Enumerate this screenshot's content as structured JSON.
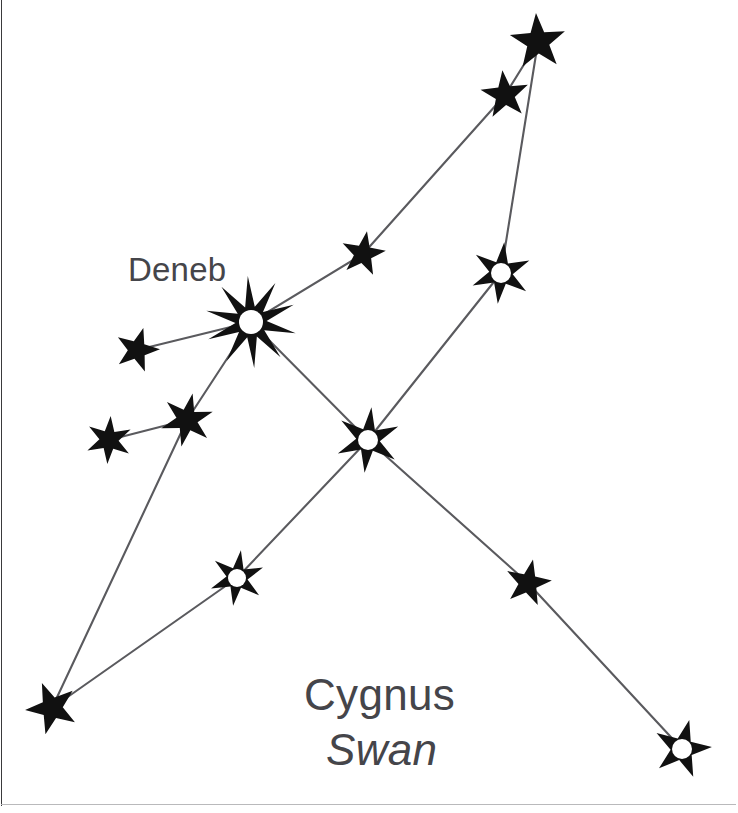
{
  "diagram": {
    "title": "Cygnus",
    "subtitle": "Swan",
    "kind": "constellation-star-chart",
    "canvas": {
      "width": 738,
      "height": 813
    },
    "colors": {
      "background": "#ffffff",
      "star_fill": "#111111",
      "line": "#5a5a5e",
      "text": "#45454a",
      "frame": "#3a3a3c"
    },
    "line_width": 2.1
  },
  "labels": {
    "deneb": "Deneb",
    "constellation_name": "Cygnus",
    "common_name": "Swan"
  },
  "chart_data": {
    "type": "scatter",
    "title": "Cygnus",
    "subtitle": "Swan",
    "xlabel": "",
    "ylabel": "",
    "grid": false,
    "legend": null,
    "xlim": [
      0,
      738
    ],
    "ylim": [
      0,
      813
    ],
    "annotations": [
      {
        "text": "Deneb",
        "x": 128,
        "y": 272,
        "style": "regular",
        "size": 33
      },
      {
        "text": "Cygnus",
        "x": 304,
        "y": 700,
        "style": "regular",
        "size": 44
      },
      {
        "text": "Swan",
        "x": 326,
        "y": 755,
        "style": "italic",
        "size": 44
      }
    ],
    "points": [
      {
        "id": "deneb",
        "label": "Deneb",
        "x": 251,
        "y": 322,
        "r": 46,
        "points": 10,
        "inner": 0.34,
        "hole": 12,
        "rot": -4
      },
      {
        "id": "wing_l1",
        "label": "",
        "x": 137,
        "y": 350,
        "r": 23,
        "points": 5,
        "inner": 0.4,
        "hole": 0,
        "rot": 16
      },
      {
        "id": "wing_l2",
        "label": "",
        "x": 187,
        "y": 420,
        "r": 27,
        "points": 6,
        "inner": 0.4,
        "hole": 0,
        "rot": 12
      },
      {
        "id": "wing_l3",
        "label": "",
        "x": 109,
        "y": 440,
        "r": 24,
        "points": 6,
        "inner": 0.4,
        "hole": 0,
        "rot": 4
      },
      {
        "id": "tail_sw",
        "label": "",
        "x": 52,
        "y": 708,
        "r": 27,
        "points": 5,
        "inner": 0.4,
        "hole": 0,
        "rot": -22
      },
      {
        "id": "mid_sw",
        "label": "",
        "x": 237,
        "y": 578,
        "r": 28,
        "points": 6,
        "inner": 0.38,
        "hole": 9,
        "rot": 8
      },
      {
        "id": "sadr",
        "label": "",
        "x": 368,
        "y": 440,
        "r": 33,
        "points": 6,
        "inner": 0.36,
        "hole": 10,
        "rot": 6
      },
      {
        "id": "mid_ne",
        "label": "",
        "x": 363,
        "y": 254,
        "r": 23,
        "points": 5,
        "inner": 0.4,
        "hole": 0,
        "rot": 10
      },
      {
        "id": "wing_r2",
        "label": "",
        "x": 505,
        "y": 95,
        "r": 25,
        "points": 5,
        "inner": 0.4,
        "hole": 0,
        "rot": -6
      },
      {
        "id": "wing_r1",
        "label": "",
        "x": 538,
        "y": 42,
        "r": 29,
        "points": 5,
        "inner": 0.4,
        "hole": 0,
        "rot": -4
      },
      {
        "id": "wing_r3",
        "label": "",
        "x": 501,
        "y": 273,
        "r": 31,
        "points": 6,
        "inner": 0.38,
        "hole": 10,
        "rot": 6
      },
      {
        "id": "mid_se",
        "label": "",
        "x": 528,
        "y": 583,
        "r": 24,
        "points": 5,
        "inner": 0.4,
        "hole": 0,
        "rot": 12
      },
      {
        "id": "albireo",
        "label": "",
        "x": 682,
        "y": 749,
        "r": 30,
        "points": 5,
        "inner": 0.38,
        "hole": 10,
        "rot": 14
      }
    ],
    "edges": [
      [
        "deneb",
        "wing_l1"
      ],
      [
        "deneb",
        "wing_l2"
      ],
      [
        "wing_l2",
        "wing_l3"
      ],
      [
        "wing_l2",
        "tail_sw"
      ],
      [
        "tail_sw",
        "mid_sw"
      ],
      [
        "mid_sw",
        "sadr"
      ],
      [
        "deneb",
        "mid_ne"
      ],
      [
        "mid_ne",
        "wing_r2"
      ],
      [
        "wing_r2",
        "wing_r1"
      ],
      [
        "wing_r1",
        "wing_r3"
      ],
      [
        "wing_r3",
        "sadr"
      ],
      [
        "deneb",
        "sadr"
      ],
      [
        "sadr",
        "mid_se"
      ],
      [
        "mid_se",
        "albireo"
      ]
    ]
  }
}
